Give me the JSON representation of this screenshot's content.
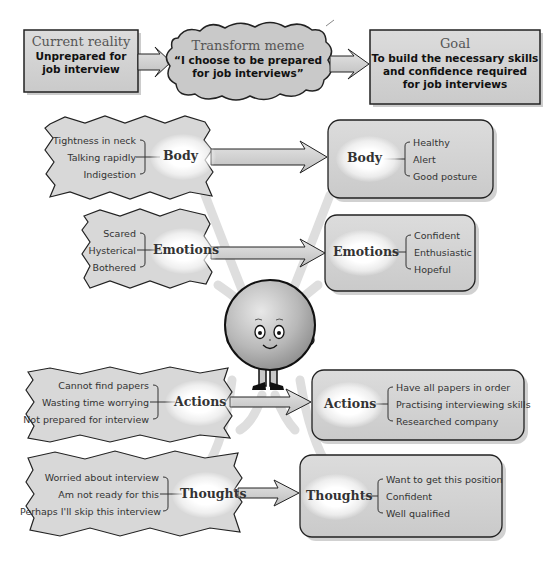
{
  "colors": {
    "box_fill": "#d6d6d6",
    "box_stroke": "#222222",
    "arrow_fill": "#cfcfcf",
    "curve_fill": "#e0e0e0",
    "character_fill": "#bdbdbd"
  },
  "top_row": {
    "current_reality": {
      "title": "Current reality",
      "lines": [
        "Unprepared for",
        "job interview"
      ]
    },
    "transform_meme": {
      "title": "Transform meme",
      "lines": [
        "“I choose to be prepared",
        "for job interviews”"
      ]
    },
    "goal": {
      "title": "Goal",
      "lines": [
        "To build the necessary skills",
        "and confidence required",
        "for job interviews"
      ]
    }
  },
  "rows": [
    {
      "category": "Body",
      "current": [
        "Tightness in neck",
        "Talking rapidly",
        "Indigestion"
      ],
      "desired": [
        "Healthy",
        "Alert",
        "Good posture"
      ]
    },
    {
      "category": "Emotions",
      "current": [
        "Scared",
        "Hysterical",
        "Bothered"
      ],
      "desired": [
        "Confident",
        "Enthusiastic",
        "Hopeful"
      ]
    },
    {
      "category": "Actions",
      "current": [
        "Cannot find papers",
        "Wasting time worrying",
        "Not prepared for interview"
      ],
      "desired": [
        "Have all papers in order",
        "Practising interviewing skills",
        "Researched company"
      ]
    },
    {
      "category": "Thoughts",
      "current": [
        "Worried about interview",
        "Am not ready for this",
        "Perhaps I'll skip this interview"
      ],
      "desired": [
        "Want to get this position",
        "Confident",
        "Well qualified"
      ]
    }
  ],
  "icons": {
    "character": "smiling-round-character-icon"
  }
}
